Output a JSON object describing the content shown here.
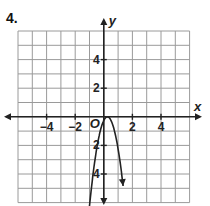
{
  "problem": {
    "number": "4."
  },
  "chart_data": {
    "type": "line",
    "title": "",
    "xlabel": "x",
    "ylabel": "y",
    "xlim": [
      -6,
      6
    ],
    "ylim": [
      -6,
      6
    ],
    "grid": true,
    "grid_step": 1,
    "x_tick_labels": [
      "-4",
      "-2",
      "2",
      "4"
    ],
    "x_tick_values": [
      -4,
      -2,
      2,
      4
    ],
    "y_tick_labels": [
      "4",
      "2",
      "2",
      "4"
    ],
    "y_tick_values": [
      4,
      2,
      -2,
      -4
    ],
    "origin_label": "O",
    "series": [
      {
        "name": "parabola",
        "description": "downward-opening parabola with vertex near the origin, both ends with arrows",
        "vertex": [
          0.25,
          0
        ],
        "a": -4,
        "x": [
          -1.1,
          -0.75,
          -0.5,
          -0.25,
          0,
          0.25,
          0.5,
          0.75,
          1.0,
          1.35
        ],
        "y": [
          -7.0,
          -4.0,
          -2.25,
          -1.0,
          -0.25,
          0,
          -0.25,
          -1.0,
          -2.25,
          -4.84
        ]
      }
    ],
    "colors": {
      "grid": "#9a9a9a",
      "axis": "#222222",
      "curve": "#222222"
    }
  }
}
